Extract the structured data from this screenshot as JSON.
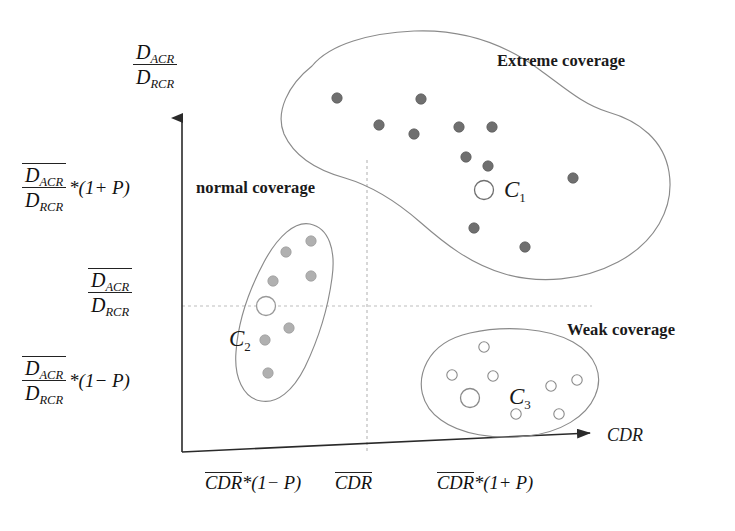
{
  "figure": {
    "type": "scatter-cluster-diagram",
    "background_color": "#ffffff",
    "axis_color": "#222222",
    "guide_color": "#b9b9b9",
    "outline_color": "#7a7a7a"
  },
  "axes": {
    "y_axis": {
      "label_numerator": "D",
      "label_numerator_sub": "ACR",
      "label_denominator": "D",
      "label_denominator_sub": "RCR",
      "ticks": [
        {
          "id": "y-tick-upper",
          "numerator": "D",
          "numerator_sub": "ACR",
          "denominator": "D",
          "denominator_sub": "RCR",
          "suffix": "*(1+ P)",
          "overline": true
        },
        {
          "id": "y-tick-mid",
          "numerator": "D",
          "numerator_sub": "ACR",
          "denominator": "D",
          "denominator_sub": "RCR",
          "suffix": "",
          "overline": true
        },
        {
          "id": "y-tick-lower",
          "numerator": "D",
          "numerator_sub": "ACR",
          "denominator": "D",
          "denominator_sub": "RCR",
          "suffix": "*(1− P)",
          "overline": true
        }
      ]
    },
    "x_axis": {
      "name": "CDR",
      "ticks": [
        {
          "id": "x-tick-left",
          "base": "CDR",
          "suffix": "*(1− P)"
        },
        {
          "id": "x-tick-center",
          "base": "CDR",
          "suffix": ""
        },
        {
          "id": "x-tick-right",
          "base": "CDR",
          "suffix": "*(1+ P)"
        }
      ]
    }
  },
  "regions": [
    {
      "id": "region-extreme",
      "label": "Extreme coverage"
    },
    {
      "id": "region-normal",
      "label": "normal coverage"
    },
    {
      "id": "region-weak",
      "label": "Weak coverage"
    }
  ],
  "clusters": [
    {
      "id": "cluster-c1",
      "name": "C",
      "subscript": "1",
      "region": "Extreme coverage",
      "point_style": "filled",
      "point_color": "#6f6f6f",
      "centroid": {
        "x": 484,
        "y": 190
      },
      "points": [
        {
          "x": 337,
          "y": 98
        },
        {
          "x": 421,
          "y": 99
        },
        {
          "x": 379,
          "y": 125
        },
        {
          "x": 414,
          "y": 134
        },
        {
          "x": 459,
          "y": 127
        },
        {
          "x": 492,
          "y": 127
        },
        {
          "x": 466,
          "y": 157
        },
        {
          "x": 488,
          "y": 166
        },
        {
          "x": 573,
          "y": 178
        },
        {
          "x": 474,
          "y": 228
        },
        {
          "x": 525,
          "y": 247
        }
      ]
    },
    {
      "id": "cluster-c2",
      "name": "C",
      "subscript": "2",
      "region": "normal coverage",
      "point_style": "filled",
      "point_color": "#aaaaaa",
      "centroid": {
        "x": 266,
        "y": 306
      },
      "points": [
        {
          "x": 311,
          "y": 241
        },
        {
          "x": 286,
          "y": 252
        },
        {
          "x": 273,
          "y": 281
        },
        {
          "x": 311,
          "y": 276
        },
        {
          "x": 289,
          "y": 328
        },
        {
          "x": 265,
          "y": 340
        },
        {
          "x": 268,
          "y": 373
        }
      ]
    },
    {
      "id": "cluster-c3",
      "name": "C",
      "subscript": "3",
      "region": "Weak coverage",
      "point_style": "hollow",
      "point_color": "#888888",
      "centroid": {
        "x": 497,
        "y": 398
      },
      "points": [
        {
          "x": 484,
          "y": 347
        },
        {
          "x": 452,
          "y": 375
        },
        {
          "x": 493,
          "y": 376
        },
        {
          "x": 551,
          "y": 386
        },
        {
          "x": 516,
          "y": 414
        },
        {
          "x": 559,
          "y": 414
        },
        {
          "x": 577,
          "y": 380
        }
      ]
    }
  ],
  "guides": {
    "vertical_dashed_x": 367,
    "horizontal_dashed_y": 306
  }
}
